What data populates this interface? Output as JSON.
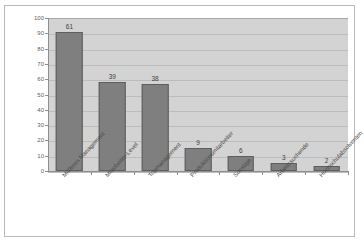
{
  "chart_data": {
    "type": "bar",
    "title": "",
    "subtitle": "",
    "xlabel": "",
    "ylabel": "",
    "ylim": [
      0,
      100
    ],
    "yticks": [
      0,
      10,
      20,
      30,
      40,
      50,
      60,
      70,
      80,
      90,
      100
    ],
    "grid": true,
    "legend": false,
    "legend_position": "none",
    "categories": [
      "Mittleres Management",
      "Mitarbeiter-Level",
      "Topmanagement",
      "Produktionsmitarbeiter",
      "Sonstige",
      "Arbeitssuchende",
      "Hochschulabsolventen"
    ],
    "values": [
      61,
      39,
      38,
      9,
      6,
      3,
      2
    ],
    "bar_plot_heights": [
      91,
      58,
      57,
      15,
      10,
      5,
      3
    ],
    "data_labels": [
      "61",
      "39",
      "38",
      "9",
      "6",
      "3",
      "2"
    ],
    "colors": {
      "bar_fill": "#7f7f7f",
      "bar_edge": "#5e5e5e",
      "plot_background": "#d3d3d3",
      "figure_background": "#ffffff",
      "gridline": "#bcbcbc",
      "axis": "#8f8f8f",
      "tick_text": "#5d5d5d",
      "label_text": "#4a4a4a",
      "figure_border": "#b9b9b9"
    }
  }
}
